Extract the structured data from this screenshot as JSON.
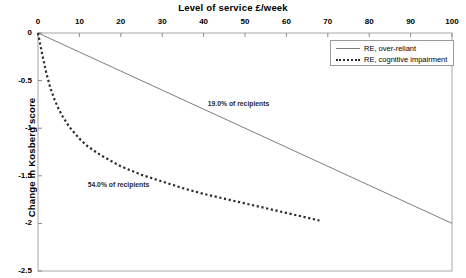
{
  "chart_data": {
    "type": "line",
    "title": "Level of service £/week",
    "xlabel": "Level of service £/week",
    "ylabel": "Change in Kosberg score",
    "xlim": [
      0,
      100
    ],
    "ylim": [
      -2.5,
      0
    ],
    "grid": false,
    "legend_position": "top-right",
    "xticks": [
      "0",
      "10",
      "20",
      "30",
      "40",
      "50",
      "60",
      "70",
      "80",
      "90",
      "100"
    ],
    "xtick_values": [
      0,
      10,
      20,
      30,
      40,
      50,
      60,
      70,
      80,
      90,
      100
    ],
    "yticks": [
      "0",
      "-0.5",
      "-1",
      "-1.5",
      "-2",
      "-2.5"
    ],
    "ytick_values": [
      0,
      -0.5,
      -1,
      -1.5,
      -2,
      -2.5
    ],
    "series": [
      {
        "name": "RE, over-reliant",
        "style": "solid",
        "color": "#7d7d7d",
        "x": [
          0,
          10,
          20,
          30,
          40,
          50,
          60,
          70,
          80,
          90,
          100
        ],
        "values": [
          0,
          -0.2,
          -0.4,
          -0.6,
          -0.8,
          -1.0,
          -1.2,
          -1.4,
          -1.6,
          -1.8,
          -2.0
        ]
      },
      {
        "name": "RE, cognitive impairment",
        "style": "dotted",
        "color": "#2b2b2b",
        "x": [
          0,
          1,
          2,
          3,
          4,
          5,
          6,
          7,
          8,
          10,
          12,
          15,
          20,
          25,
          30,
          35,
          40,
          45,
          50,
          55,
          60,
          65,
          68
        ],
        "values": [
          0,
          -0.22,
          -0.42,
          -0.58,
          -0.7,
          -0.8,
          -0.88,
          -0.95,
          -1.01,
          -1.11,
          -1.19,
          -1.28,
          -1.4,
          -1.49,
          -1.56,
          -1.63,
          -1.69,
          -1.74,
          -1.79,
          -1.84,
          -1.89,
          -1.94,
          -1.97
        ]
      }
    ],
    "annotations": [
      {
        "text": "19.0% of recipients",
        "x": 41,
        "y": -0.75
      },
      {
        "text": "54.0% of recipients",
        "x": 12,
        "y": -1.6
      }
    ]
  },
  "legend": {
    "items": [
      {
        "label": "RE, over-reliant"
      },
      {
        "label": "RE, cognitive impairment"
      }
    ]
  }
}
